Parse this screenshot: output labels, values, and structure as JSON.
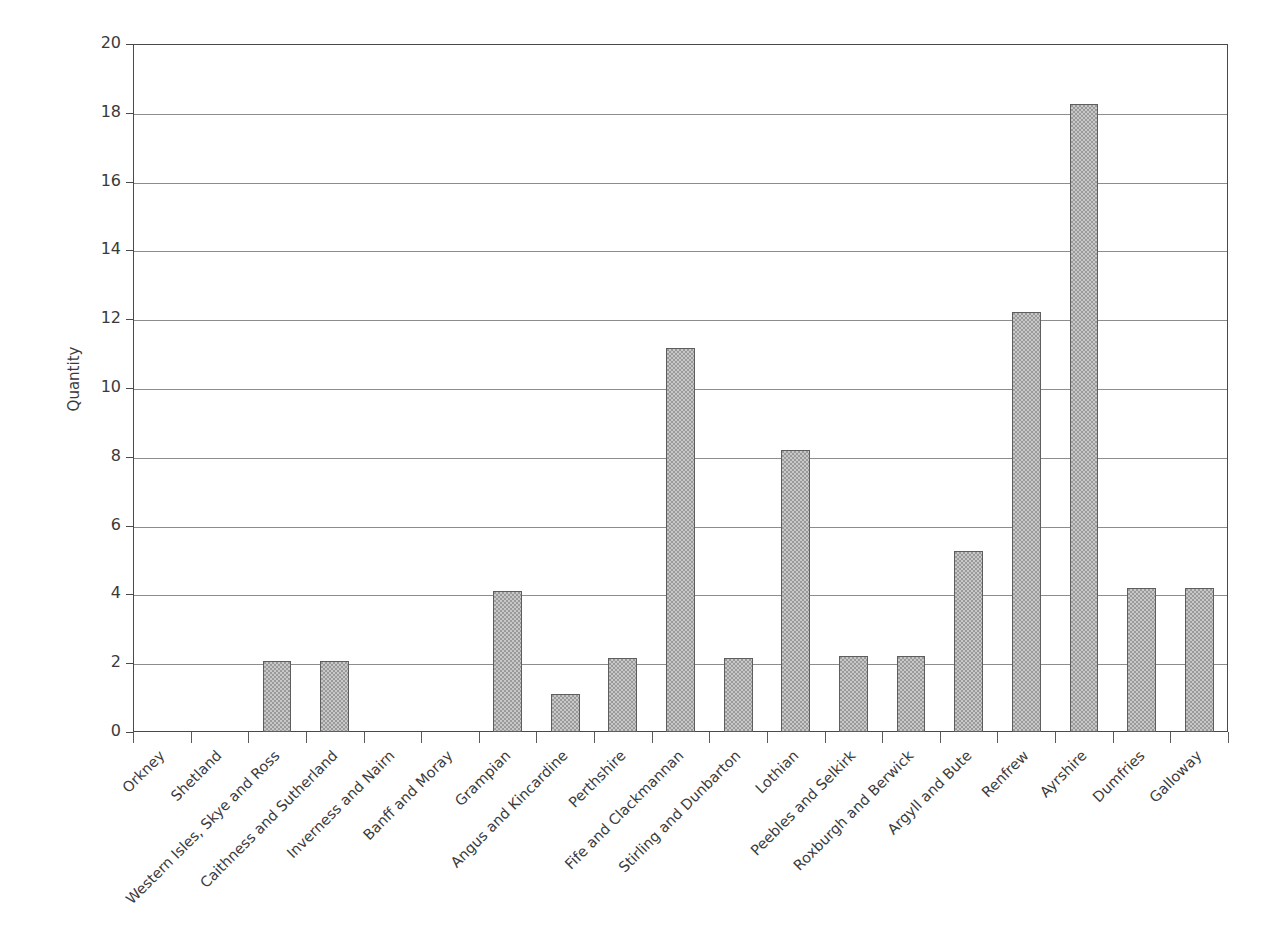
{
  "chart_data": {
    "type": "bar",
    "title": "",
    "xlabel": "",
    "ylabel": "Quantity",
    "ylim": [
      0,
      20
    ],
    "ytick_step": 2,
    "grid": true,
    "legend": "none",
    "bar_color": "#9a9a9a",
    "bar_border_color": "#5e5e5e",
    "axis_color": "#4a4a4a",
    "gridline_color": "#8d8d8d",
    "yticks": [
      "0",
      "2",
      "4",
      "6",
      "8",
      "10",
      "12",
      "14",
      "16",
      "18",
      "20"
    ],
    "categories": [
      "Orkney",
      "Shetland",
      "Western Isles, Skye and Ross",
      "Caithness and Sutherland",
      "Inverness and Nairn",
      "Banff and Moray",
      "Grampian",
      "Angus and Kincardine",
      "Perthshire",
      "Fife and Clackmannan",
      "Stirling and Dunbarton",
      "Lothian",
      "Peebles and Selkirk",
      "Roxburgh and Berwick",
      "Argyll and Bute",
      "Renfrew",
      "Ayrshire",
      "Dumfries",
      "Galloway"
    ],
    "values": [
      0,
      0,
      2.05,
      2.05,
      0,
      0,
      4.1,
      1.1,
      2.15,
      11.15,
      2.15,
      8.2,
      2.2,
      2.2,
      5.25,
      12.2,
      18.25,
      4.2,
      4.2
    ]
  }
}
